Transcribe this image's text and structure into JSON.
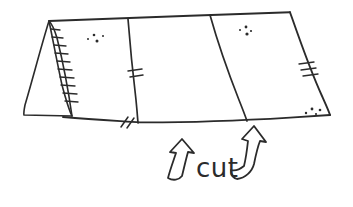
{
  "canvas": {
    "width": 353,
    "height": 207,
    "background_color": "#ffffff",
    "ink_color": "#2b2b2b",
    "style": "hand-drawn pen sketch"
  },
  "labels": {
    "cut": "cut"
  },
  "panels": [
    {
      "name": "left-panel"
    },
    {
      "name": "middle-panel"
    },
    {
      "name": "right-panel"
    }
  ],
  "geometry": {
    "sheet_outline": "M 49,21 L 128,19 L 210,15 L 290,12 L 330,115 L 247,121 L 138,123 L 63,117 Z",
    "top_edge": "M 49,21 C 90,19.5 140,17.5 190,15.8 C 235,14.4 268,12.8 290,12.2",
    "bottom_edge": "M 63,117 C 95,119.5 120,121 140,122.4 C 190,122.6 250,120 290,117.6 C 310,116.4 322,115.6 330,115",
    "right_edge": "M 290,12.2 C 298,35 310,70 322,96 C 326,105 329,111.5 330,115",
    "fold_line_1": "M 128,19 C 130,45 133,75 136,100 C 137,110 137.6,118 138,123",
    "fold_line_2": "M 210,15 C 217,40 228,72 239,100 C 243,110 245.6,117 247,121",
    "flap_outline": "M 49,21 C 42,43 33,78 25,105 C 24,110 23.6,113.5 24,115 L 72,116 C 69,95 63,62 57,38 C 54,28 51,23 49,21 Z",
    "flap_inner_edge": "M 49,21 C 52,35 57,62 62,85 C 66,100 69,110 72,116"
  },
  "annotations": {
    "flap_hatch_count": 10,
    "right_edge_hatch_count": 3,
    "fold1_tick_count": 2,
    "bottom_edge_tick_count": 2,
    "speckle_clusters": 4
  },
  "arrows": [
    {
      "name": "left-cut-arrow",
      "direction": "up",
      "description": "curved hollow arrow pointing up toward the bottom edge, left of the cut label",
      "path": "M 182,139 L 170,152 L 176,153 C 173,162 170,170 168,178 C 173,181 179,180 182,176 C 184,168 186,159 188,152 L 194,153 Z"
    },
    {
      "name": "right-cut-arrow",
      "direction": "up",
      "description": "curved hollow arrow pointing up toward the bottom edge, right of the cut label",
      "path": "M 254,126 L 242,139 L 248,141 C 247,150 246,158 244,166 C 239,170 234,171 231,170 C 231,174 233,178 237,179 C 245,178 252,172 254,164 C 256,154 258,146 260,141 L 266,142 Z"
    }
  ],
  "speckles": [
    {
      "cx": 88,
      "cy": 39,
      "r": 1.0
    },
    {
      "cx": 94,
      "cy": 35,
      "r": 1.3
    },
    {
      "cx": 97,
      "cy": 41,
      "r": 1.5
    },
    {
      "cx": 103,
      "cy": 36,
      "r": 1.0
    },
    {
      "cx": 240,
      "cy": 30,
      "r": 1.0
    },
    {
      "cx": 246,
      "cy": 27,
      "r": 1.4
    },
    {
      "cx": 247,
      "cy": 34,
      "r": 1.6
    },
    {
      "cx": 251,
      "cy": 31,
      "r": 1.1
    },
    {
      "cx": 306,
      "cy": 113,
      "r": 1.2
    },
    {
      "cx": 312,
      "cy": 109,
      "r": 1.4
    },
    {
      "cx": 316,
      "cy": 114,
      "r": 1.1
    },
    {
      "cx": 320,
      "cy": 110,
      "r": 1.3
    }
  ],
  "flap_hatches": [
    {
      "x1": 51,
      "y1": 29,
      "x2": 60,
      "y2": 30
    },
    {
      "x1": 52,
      "y1": 37,
      "x2": 63,
      "y2": 38
    },
    {
      "x1": 54,
      "y1": 45,
      "x2": 66,
      "y2": 46
    },
    {
      "x1": 55,
      "y1": 53,
      "x2": 68,
      "y2": 54
    },
    {
      "x1": 57,
      "y1": 61,
      "x2": 70,
      "y2": 62
    },
    {
      "x1": 58,
      "y1": 69,
      "x2": 72,
      "y2": 70
    },
    {
      "x1": 60,
      "y1": 77,
      "x2": 74,
      "y2": 78
    },
    {
      "x1": 61,
      "y1": 85,
      "x2": 75,
      "y2": 86
    },
    {
      "x1": 63,
      "y1": 93,
      "x2": 77,
      "y2": 94
    },
    {
      "x1": 65,
      "y1": 101,
      "x2": 78,
      "y2": 102
    }
  ],
  "right_hatches": [
    {
      "x1": 299,
      "y1": 64,
      "x2": 314,
      "y2": 62
    },
    {
      "x1": 301,
      "y1": 70,
      "x2": 316,
      "y2": 68
    },
    {
      "x1": 303,
      "y1": 76,
      "x2": 318,
      "y2": 74
    }
  ],
  "fold_ticks": [
    {
      "x1": 128,
      "y1": 71,
      "x2": 142,
      "y2": 69
    },
    {
      "x1": 130,
      "y1": 77,
      "x2": 143,
      "y2": 75
    }
  ],
  "bottom_ticks": [
    {
      "x1": 121,
      "y1": 127,
      "x2": 128,
      "y2": 117
    },
    {
      "x1": 127,
      "y1": 128,
      "x2": 134,
      "y2": 118
    }
  ]
}
